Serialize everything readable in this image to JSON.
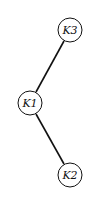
{
  "diagram": {
    "type": "binary-tree",
    "nodes": [
      {
        "id": "K3",
        "label": "K3",
        "cx": 70,
        "cy": 30,
        "r": 12
      },
      {
        "id": "K1",
        "label": "K1",
        "cx": 30,
        "cy": 103,
        "r": 12
      },
      {
        "id": "K2",
        "label": "K2",
        "cx": 70,
        "cy": 175,
        "r": 12
      }
    ],
    "edges": [
      {
        "from": "K3",
        "to": "K1"
      },
      {
        "from": "K1",
        "to": "K2"
      }
    ],
    "colors": {
      "stroke": "#111111",
      "fill": "#ffffff",
      "background": "#ffffff"
    }
  }
}
